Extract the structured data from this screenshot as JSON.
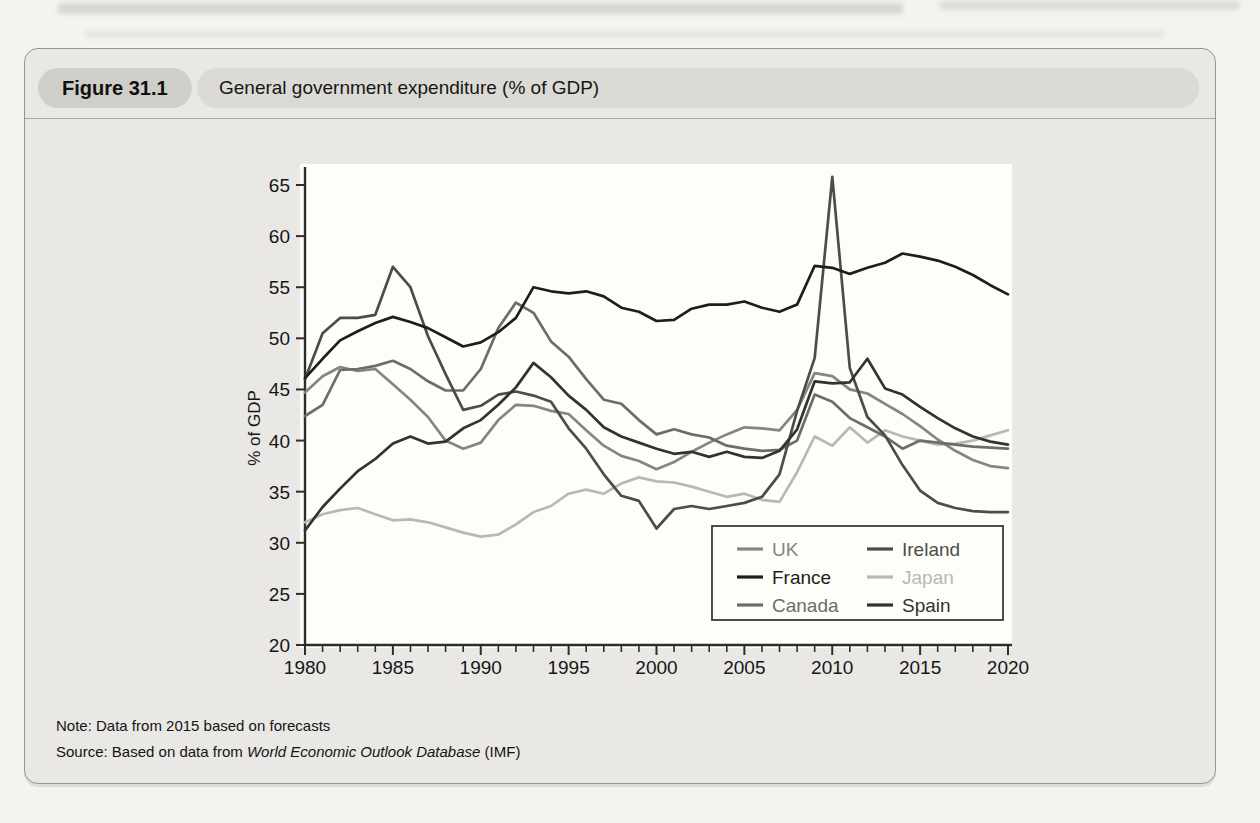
{
  "figure": {
    "label": "Figure 31.1",
    "title": "General government expenditure (% of GDP)",
    "note": "Note: Data from 2015 based on forecasts",
    "source_prefix": "Source: Based on data from ",
    "source_italic": "World Economic Outlook Database",
    "source_suffix": " (IMF)"
  },
  "chart_data": {
    "type": "line",
    "title": "General government expenditure (% of GDP)",
    "xlabel": "",
    "ylabel": "% of GDP",
    "x_range": [
      1980,
      2020
    ],
    "ylim": [
      20,
      65
    ],
    "grid": false,
    "legend_position": "lower-right-inside",
    "x_major_ticks": [
      1980,
      1985,
      1990,
      1995,
      2000,
      2005,
      2010,
      2015,
      2020
    ],
    "y_ticks": [
      20,
      25,
      30,
      35,
      40,
      45,
      50,
      55,
      60,
      65
    ],
    "x_minor_tick_interval_years": 1,
    "legend_columns": [
      [
        "UK",
        "France",
        "Canada"
      ],
      [
        "Ireland",
        "Japan",
        "Spain"
      ]
    ],
    "x_start": 1980,
    "series": [
      {
        "name": "Japan",
        "color": "#b9b8b4",
        "values": [
          32.0,
          32.8,
          33.2,
          33.4,
          32.8,
          32.2,
          32.3,
          32.0,
          31.5,
          31.0,
          30.6,
          30.8,
          31.8,
          33.0,
          33.6,
          34.8,
          35.2,
          34.8,
          35.8,
          36.4,
          36.0,
          35.9,
          35.5,
          35.0,
          34.5,
          34.8,
          34.2,
          34.0,
          36.9,
          40.4,
          39.5,
          41.3,
          39.8,
          41.0,
          40.4,
          40.0,
          39.6,
          39.7,
          40.0,
          40.5,
          41.0
        ]
      },
      {
        "name": "UK",
        "color": "#86857f",
        "values": [
          44.7,
          46.3,
          47.2,
          46.8,
          47.0,
          45.5,
          44.0,
          42.3,
          40.0,
          39.2,
          39.8,
          42.0,
          43.5,
          43.4,
          42.9,
          42.6,
          41.0,
          39.5,
          38.5,
          38.0,
          37.2,
          37.9,
          38.9,
          39.8,
          40.6,
          41.3,
          41.2,
          41.0,
          43.0,
          46.6,
          46.3,
          45.0,
          44.6,
          43.6,
          42.6,
          41.4,
          40.1,
          39.0,
          38.1,
          37.5,
          37.3
        ]
      },
      {
        "name": "Canada",
        "color": "#6d6c68",
        "values": [
          42.4,
          43.5,
          46.9,
          47.0,
          47.3,
          47.8,
          47.0,
          45.8,
          44.9,
          44.9,
          47.0,
          51.0,
          53.5,
          52.5,
          49.7,
          48.2,
          46.0,
          44.0,
          43.6,
          42.0,
          40.6,
          41.1,
          40.6,
          40.3,
          39.5,
          39.2,
          39.0,
          39.1,
          40.0,
          44.5,
          43.8,
          42.2,
          41.3,
          40.4,
          39.2,
          40.0,
          39.8,
          39.6,
          39.4,
          39.3,
          39.2
        ]
      },
      {
        "name": "Ireland",
        "color": "#4d4c49",
        "values": [
          46.0,
          50.5,
          52.0,
          52.0,
          52.3,
          57.0,
          55.0,
          50.2,
          46.5,
          43.0,
          43.4,
          44.5,
          44.8,
          44.4,
          43.8,
          41.2,
          39.2,
          36.7,
          34.6,
          34.1,
          31.4,
          33.3,
          33.6,
          33.3,
          33.6,
          33.9,
          34.5,
          36.7,
          42.9,
          48.1,
          65.8,
          47.1,
          42.3,
          40.5,
          37.6,
          35.1,
          33.9,
          33.4,
          33.1,
          33.0,
          33.0
        ]
      },
      {
        "name": "Spain",
        "color": "#33322f",
        "values": [
          31.2,
          33.5,
          35.3,
          37.0,
          38.2,
          39.7,
          40.4,
          39.7,
          39.9,
          41.2,
          42.0,
          43.5,
          45.2,
          47.6,
          46.2,
          44.4,
          43.0,
          41.3,
          40.4,
          39.8,
          39.2,
          38.7,
          38.9,
          38.4,
          38.9,
          38.4,
          38.3,
          39.0,
          41.1,
          45.8,
          45.6,
          45.7,
          48.0,
          45.1,
          44.5,
          43.3,
          42.2,
          41.2,
          40.4,
          39.9,
          39.6
        ]
      },
      {
        "name": "France",
        "color": "#1d1d1b",
        "values": [
          46.1,
          48.0,
          49.8,
          50.7,
          51.5,
          52.1,
          51.6,
          51.0,
          50.1,
          49.2,
          49.6,
          50.6,
          52.0,
          55.0,
          54.6,
          54.4,
          54.6,
          54.1,
          53.0,
          52.6,
          51.7,
          51.8,
          52.9,
          53.3,
          53.3,
          53.6,
          53.0,
          52.6,
          53.3,
          57.1,
          56.9,
          56.3,
          56.9,
          57.4,
          58.3,
          58.0,
          57.6,
          57.0,
          56.2,
          55.2,
          54.3
        ]
      }
    ]
  }
}
